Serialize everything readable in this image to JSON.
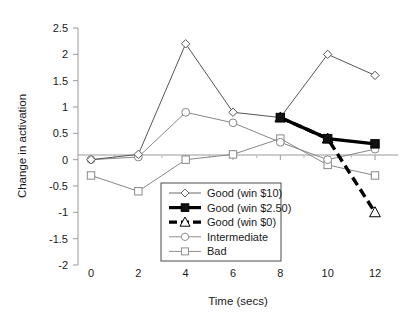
{
  "chart_data": {
    "type": "line",
    "title": "",
    "xlabel": "Time (secs)",
    "ylabel": "Change in activation",
    "x": [
      0,
      2,
      4,
      6,
      8,
      10,
      12
    ],
    "xticklabels": [
      "0",
      "2",
      "4",
      "6",
      "8",
      "10",
      "12"
    ],
    "yticklabels": [
      "2.5",
      "2",
      "1.5",
      "1",
      "0.5",
      "0",
      "-0.5",
      "-1",
      "-1.5",
      "-2"
    ],
    "xlim": [
      -1,
      13
    ],
    "ylim": [
      -2,
      2.5
    ],
    "ytick_step": 0.5,
    "grid": false,
    "legend_position": "inside-bottom-center",
    "zero_line": true,
    "series": [
      {
        "name": "Good (win $10)",
        "marker": "diamond-open",
        "line": "thin-solid",
        "color": "#555555",
        "x": [
          0,
          2,
          4,
          6,
          8,
          10,
          12
        ],
        "values": [
          0.0,
          0.1,
          2.2,
          0.9,
          0.8,
          2.0,
          1.6
        ]
      },
      {
        "name": "Good (win $2.50)",
        "marker": "square-filled",
        "line": "thick-solid",
        "color": "#000000",
        "x": [
          8,
          10,
          12
        ],
        "values": [
          0.8,
          0.4,
          0.3
        ]
      },
      {
        "name": "Good (win $0)",
        "marker": "triangle-open",
        "line": "thick-dashed",
        "color": "#000000",
        "x": [
          8,
          10,
          12
        ],
        "values": [
          0.8,
          0.4,
          -1.0
        ]
      },
      {
        "name": "Intermediate",
        "marker": "circle-open",
        "line": "thin-solid",
        "color": "#888888",
        "x": [
          0,
          2,
          4,
          6,
          8,
          10,
          12
        ],
        "values": [
          0.0,
          0.05,
          0.9,
          0.7,
          0.33,
          0.0,
          0.2
        ]
      },
      {
        "name": "Bad",
        "marker": "square-open",
        "line": "thin-solid",
        "color": "#888888",
        "x": [
          0,
          2,
          4,
          6,
          8,
          10,
          12
        ],
        "values": [
          -0.3,
          -0.6,
          0.0,
          0.1,
          0.4,
          -0.1,
          -0.3
        ]
      }
    ]
  },
  "axes": {
    "y_title": "Change in activation",
    "x_title": "Time (secs)",
    "y_ticks": [
      "2.5",
      "2",
      "1.5",
      "1",
      "0.5",
      "0",
      "-0.5",
      "-1",
      "-1.5",
      "-2"
    ],
    "x_ticks": [
      "0",
      "2",
      "4",
      "6",
      "8",
      "10",
      "12"
    ]
  },
  "legend": {
    "items": [
      {
        "label": "Good (win $10)"
      },
      {
        "label": "Good (win $2.50)"
      },
      {
        "label": "Good (win $0)"
      },
      {
        "label": "Intermediate"
      },
      {
        "label": "Bad"
      }
    ]
  },
  "colors": {
    "axis": "#9a9a9a",
    "thin_line": "#6b6b6b",
    "gray_line": "#8f8f8f",
    "thick_line": "#000000",
    "text": "#1a1a1a",
    "legend_border": "#4a4a4a",
    "background": "#ffffff"
  }
}
